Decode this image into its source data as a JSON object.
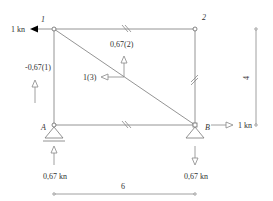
{
  "diagram": {
    "type": "truss",
    "nodes": [
      {
        "id": "1",
        "label": "1",
        "x": 54,
        "y": 29
      },
      {
        "id": "2",
        "label": "2",
        "x": 195,
        "y": 29
      },
      {
        "id": "A",
        "label": "A",
        "x": 54,
        "y": 125
      },
      {
        "id": "B",
        "label": "B",
        "x": 195,
        "y": 125
      }
    ],
    "members": [
      {
        "from": "1",
        "to": "2",
        "tick": true
      },
      {
        "from": "2",
        "to": "B",
        "tick": true
      },
      {
        "from": "A",
        "to": "B",
        "tick": true
      },
      {
        "from": "1",
        "to": "A",
        "tick": false
      },
      {
        "from": "1",
        "to": "B",
        "tick": false
      }
    ],
    "loads": {
      "applied_force": "1 kn",
      "horizontal_reaction_B": "1 kn",
      "reaction_A": "0,67 kn",
      "reaction_B": "0,67 kn"
    },
    "member_forces": {
      "member_1": "-0,67(1)",
      "member_2": "0,67(2)",
      "member_3": "1(3)"
    },
    "dimensions": {
      "width": "6",
      "height": "4"
    },
    "colors": {
      "line": "#777777",
      "text": "#333333",
      "arrow_fill": "#000000"
    }
  }
}
